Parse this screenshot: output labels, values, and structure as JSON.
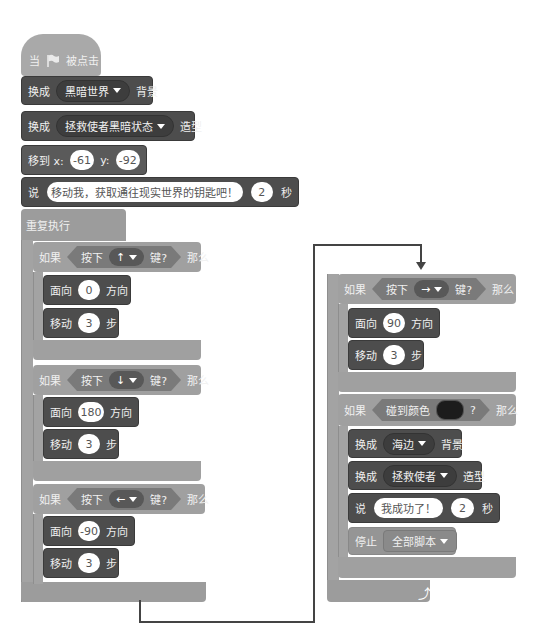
{
  "left_script": {
    "hat": {
      "when": "当",
      "flag_icon": "green-flag",
      "clicked": "被点击"
    },
    "switch_backdrop": {
      "label": "换成",
      "value": "黑暗世界",
      "suffix": "背景"
    },
    "switch_costume": {
      "label": "换成",
      "value": "拯救使者黑暗状态",
      "suffix": "造型"
    },
    "goto": {
      "label": "移到 x:",
      "x": "-61",
      "y_label": "y:",
      "y": "-92"
    },
    "say": {
      "label": "说",
      "message": "移动我，获取通往现实世界的钥匙吧！",
      "secs": "2",
      "suffix": "秒"
    },
    "forever": {
      "label": "重复执行"
    },
    "ifs": [
      {
        "if_label": "如果",
        "cond_label": "按下",
        "key": "↑",
        "cond_suffix": "键?",
        "then": "那么",
        "point": {
          "label": "面向",
          "value": "0",
          "suffix": "方向"
        },
        "move": {
          "label": "移动",
          "value": "3",
          "suffix": "步"
        }
      },
      {
        "if_label": "如果",
        "cond_label": "按下",
        "key": "↓",
        "cond_suffix": "键?",
        "then": "那么",
        "point": {
          "label": "面向",
          "value": "180",
          "suffix": "方向"
        },
        "move": {
          "label": "移动",
          "value": "3",
          "suffix": "步"
        }
      },
      {
        "if_label": "如果",
        "cond_label": "按下",
        "key": "←",
        "cond_suffix": "键?",
        "then": "那么",
        "point": {
          "label": "面向",
          "value": "-90",
          "suffix": "方向"
        },
        "move": {
          "label": "移动",
          "value": "3",
          "suffix": "步"
        }
      }
    ]
  },
  "right_script": {
    "if_right": {
      "if_label": "如果",
      "cond_label": "按下",
      "key": "→",
      "cond_suffix": "键?",
      "then": "那么",
      "point": {
        "label": "面向",
        "value": "90",
        "suffix": "方向"
      },
      "move": {
        "label": "移动",
        "value": "3",
        "suffix": "步"
      }
    },
    "if_color": {
      "if_label": "如果",
      "cond_label": "碰到颜色",
      "cond_suffix": "?",
      "then": "那么",
      "color": "#1c1c1c",
      "switch_backdrop": {
        "label": "换成",
        "value": "海边",
        "suffix": "背景"
      },
      "switch_costume": {
        "label": "换成",
        "value": "拯救使者",
        "suffix": "造型"
      },
      "say": {
        "label": "说",
        "message": "我成功了！",
        "secs": "2",
        "suffix": "秒"
      },
      "stop": {
        "label": "停止",
        "value": "全部脚本"
      }
    },
    "loop_arrow_icon": "loop-arrow"
  },
  "colors": {
    "event": "#a9a9a9",
    "looks": "#4d4d4d",
    "control": "#9c9c9c",
    "sensing": "#7a7a7a",
    "connector": "#444444"
  }
}
